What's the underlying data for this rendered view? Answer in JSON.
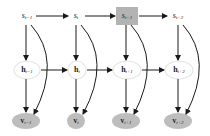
{
  "diagram": {
    "colors": {
      "edge": "#1a1a1a",
      "highlight_fill": "#b3b3b3",
      "observed_fill": "#bdbdbd",
      "hidden_fill": "#ffffff",
      "hidden_stroke": "#e6e6e6"
    },
    "columns": [
      {
        "s": {
          "base": "s",
          "sub": "t−1",
          "highlighted": false
        },
        "h": {
          "base": "h",
          "sub": "t−1"
        },
        "v": {
          "base": "v",
          "sub": "t−1"
        }
      },
      {
        "s": {
          "base": "s",
          "sub": "t",
          "highlighted": false
        },
        "h": {
          "base": "h",
          "sub": "t"
        },
        "v": {
          "base": "v",
          "sub": "t"
        }
      },
      {
        "s": {
          "base": "s",
          "sub": "t+1",
          "highlighted": true
        },
        "h": {
          "base": "h",
          "sub": "t+1"
        },
        "v": {
          "base": "v",
          "sub": "t+1"
        }
      },
      {
        "s": {
          "base": "s",
          "sub": "t+2",
          "highlighted": false
        },
        "h": {
          "base": "h",
          "sub": "t+2"
        },
        "v": {
          "base": "v",
          "sub": "t+2"
        }
      }
    ],
    "edges": [
      "s_t-1 -> s_t",
      "s_t -> s_t+1",
      "s_t+1 -> s_t+2",
      "h_t-1 -> h_t",
      "h_t -> h_t+1",
      "h_t+1 -> h_t+2",
      "s_i -> h_i",
      "h_i -> v_i",
      "s_i -> v_i (curved)"
    ]
  }
}
